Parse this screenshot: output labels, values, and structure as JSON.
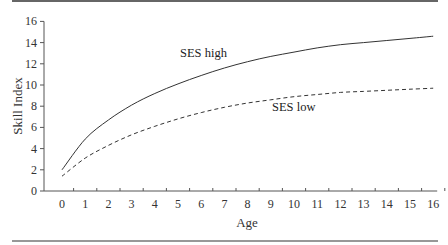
{
  "chart_data": {
    "type": "line",
    "title": "",
    "xlabel": "Age",
    "ylabel": "Skill Index",
    "x": [
      0,
      1,
      2,
      3,
      4,
      5,
      6,
      7,
      8,
      9,
      10,
      11,
      12,
      13,
      14,
      15,
      16
    ],
    "xticks": [
      "0",
      "1",
      "2",
      "3",
      "4",
      "5",
      "6",
      "7",
      "8",
      "9",
      "10",
      "11",
      "12",
      "13",
      "14",
      "15",
      "16"
    ],
    "yticks": [
      "0",
      "2",
      "4",
      "6",
      "8",
      "10",
      "12",
      "14",
      "16"
    ],
    "xlim": [
      0,
      16
    ],
    "ylim": [
      0,
      16
    ],
    "grid": false,
    "legend": "none (inline labels)",
    "series": [
      {
        "name": "SES high",
        "style": "solid",
        "values": [
          2.0,
          4.9,
          6.7,
          8.1,
          9.2,
          10.1,
          10.9,
          11.6,
          12.2,
          12.7,
          13.1,
          13.5,
          13.8,
          14.0,
          14.2,
          14.4,
          14.6
        ]
      },
      {
        "name": "SES low",
        "style": "dashed",
        "values": [
          1.4,
          3.1,
          4.3,
          5.3,
          6.1,
          6.8,
          7.4,
          7.9,
          8.3,
          8.6,
          8.9,
          9.1,
          9.3,
          9.4,
          9.5,
          9.6,
          9.7
        ]
      }
    ],
    "annotations": [
      {
        "text": "SES high",
        "series": "SES high"
      },
      {
        "text": "SES low",
        "series": "SES low"
      }
    ]
  },
  "colors": {
    "line": "#333333",
    "axis": "#555555",
    "rule": "#333333"
  }
}
